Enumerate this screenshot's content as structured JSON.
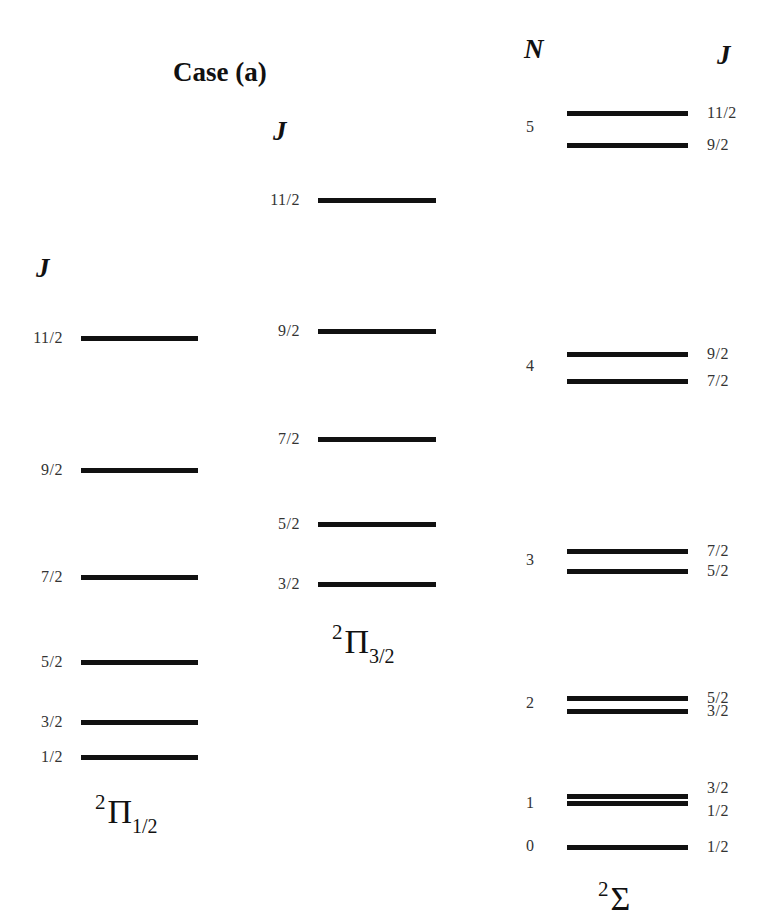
{
  "title": "Case (a)",
  "pi_half": {
    "header": "J",
    "term_symbol": {
      "multiplicity": "2",
      "symbol": "Π",
      "subscript": "1/2"
    },
    "levels": [
      {
        "J": "11/2"
      },
      {
        "J": "9/2"
      },
      {
        "J": "7/2"
      },
      {
        "J": "5/2"
      },
      {
        "J": "3/2"
      },
      {
        "J": "1/2"
      }
    ]
  },
  "pi_three_half": {
    "header": "J",
    "term_symbol": {
      "multiplicity": "2",
      "symbol": "Π",
      "subscript": "3/2"
    },
    "levels": [
      {
        "J": "11/2"
      },
      {
        "J": "9/2"
      },
      {
        "J": "7/2"
      },
      {
        "J": "5/2"
      },
      {
        "J": "3/2"
      }
    ]
  },
  "sigma": {
    "header_n": "N",
    "header_j": "J",
    "term_symbol": {
      "multiplicity": "2",
      "symbol": "Σ"
    },
    "groups": [
      {
        "N": "5",
        "levels": [
          {
            "J": "11/2"
          },
          {
            "J": "9/2"
          }
        ]
      },
      {
        "N": "4",
        "levels": [
          {
            "J": "9/2"
          },
          {
            "J": "7/2"
          }
        ]
      },
      {
        "N": "3",
        "levels": [
          {
            "J": "7/2"
          },
          {
            "J": "5/2"
          }
        ]
      },
      {
        "N": "2",
        "levels": [
          {
            "J": "5/2"
          },
          {
            "J": "3/2"
          }
        ]
      },
      {
        "N": "1",
        "levels": [
          {
            "J": "3/2"
          },
          {
            "J": "1/2"
          }
        ]
      },
      {
        "N": "0",
        "levels": [
          {
            "J": "1/2"
          }
        ]
      }
    ]
  }
}
